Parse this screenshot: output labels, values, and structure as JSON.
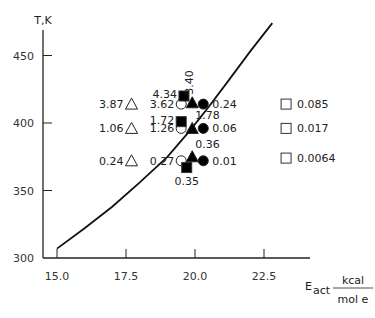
{
  "chart_data": {
    "type": "scatter",
    "title": "",
    "ylabel": "T,K",
    "xlabel": "E_act, kcal/mole",
    "xlabel_parts": {
      "main": "E",
      "sub": "act",
      "num": "kcal",
      "den": "mol  e"
    },
    "xlim": [
      15.0,
      23.5
    ],
    "ylim": [
      300,
      470
    ],
    "x_ticks": [
      15.0,
      17.5,
      20.0,
      22.5
    ],
    "x_tick_labels": [
      "15.0",
      "17.5",
      "20.0",
      "22.5"
    ],
    "y_ticks": [
      300,
      350,
      400,
      450
    ],
    "y_tick_labels": [
      "300",
      "350",
      "400",
      "450"
    ],
    "grid": false,
    "curve": {
      "name": "boundary curve",
      "points": [
        [
          15.0,
          307
        ],
        [
          16.0,
          322
        ],
        [
          17.0,
          338
        ],
        [
          18.0,
          356
        ],
        [
          19.0,
          375
        ],
        [
          19.8,
          394
        ],
        [
          20.5,
          412
        ],
        [
          21.2,
          431
        ],
        [
          22.0,
          453
        ],
        [
          22.8,
          474
        ]
      ]
    },
    "series": [
      {
        "name": "open-triangle",
        "marker": "triangle-open",
        "points": [
          {
            "x": 17.7,
            "y": 414,
            "label": "3.87"
          },
          {
            "x": 17.7,
            "y": 396,
            "label": "1.06"
          },
          {
            "x": 17.7,
            "y": 372,
            "label": "0.24"
          }
        ]
      },
      {
        "name": "open-circle",
        "marker": "circle-open",
        "points": [
          {
            "x": 19.5,
            "y": 414,
            "label": "3.62"
          },
          {
            "x": 19.5,
            "y": 396,
            "label": "1.26"
          },
          {
            "x": 19.5,
            "y": 372,
            "label": "0.27"
          }
        ]
      },
      {
        "name": "filled-square",
        "marker": "square-filled",
        "points": [
          {
            "x": 19.6,
            "y": 420,
            "label": "4.34"
          },
          {
            "x": 19.5,
            "y": 401,
            "label": "1.72"
          },
          {
            "x": 19.7,
            "y": 367,
            "label": "0.35"
          }
        ]
      },
      {
        "name": "filled-triangle",
        "marker": "triangle-filled",
        "points": [
          {
            "x": 19.9,
            "y": 415,
            "label": "3.40"
          },
          {
            "x": 19.9,
            "y": 396,
            "label": "1.78"
          },
          {
            "x": 19.9,
            "y": 375,
            "label": "0.36"
          }
        ]
      },
      {
        "name": "filled-circle",
        "marker": "circle-filled",
        "points": [
          {
            "x": 20.3,
            "y": 414,
            "label": "0.24"
          },
          {
            "x": 20.3,
            "y": 396,
            "label": "0.06"
          },
          {
            "x": 20.3,
            "y": 372,
            "label": "0.01"
          }
        ]
      },
      {
        "name": "open-square",
        "marker": "square-open",
        "points": [
          {
            "x": 23.3,
            "y": 414,
            "label": "0.085"
          },
          {
            "x": 23.3,
            "y": 396,
            "label": "0.017"
          },
          {
            "x": 23.3,
            "y": 374,
            "label": "0.0064"
          }
        ]
      }
    ]
  }
}
